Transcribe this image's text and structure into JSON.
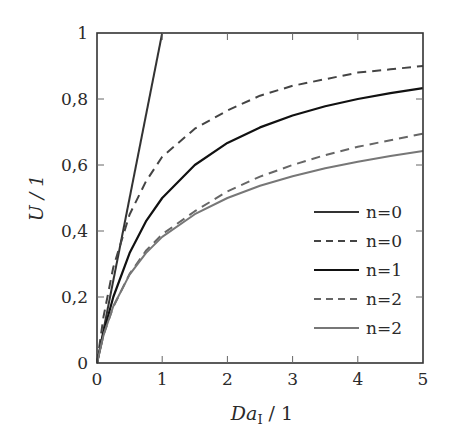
{
  "chart_data": {
    "type": "line",
    "title": "",
    "xlabel": "Da_I / 1",
    "xlabel_main": "Da",
    "xlabel_sub": "I",
    "xlabel_unit": " / 1",
    "ylabel": "U / 1",
    "xlim": [
      0,
      5
    ],
    "ylim": [
      0,
      1
    ],
    "grid": false,
    "legend_position": "lower right",
    "x_ticks": [
      "0",
      "1",
      "2",
      "3",
      "4",
      "5"
    ],
    "y_ticks": [
      "0",
      "0,2",
      "0,4",
      "0,6",
      "0,8",
      "1"
    ],
    "series": [
      {
        "name": "n=0",
        "style": "solid",
        "color": "#333333",
        "width": 2,
        "x": [
          0,
          1.0
        ],
        "y": [
          0,
          1.0
        ]
      },
      {
        "name": "n=0",
        "style": "dashed",
        "color": "#444444",
        "width": 2,
        "x": [
          0,
          0.1,
          0.25,
          0.5,
          0.75,
          1,
          1.5,
          2,
          2.5,
          3,
          3.5,
          4,
          4.5,
          5
        ],
        "y": [
          0,
          0.14,
          0.29,
          0.45,
          0.55,
          0.625,
          0.71,
          0.765,
          0.81,
          0.84,
          0.86,
          0.88,
          0.89,
          0.9
        ]
      },
      {
        "name": "n=1",
        "style": "solid",
        "color": "#111111",
        "width": 2.2,
        "x": [
          0,
          0.1,
          0.25,
          0.5,
          0.75,
          1,
          1.5,
          2,
          2.5,
          3,
          3.5,
          4,
          4.5,
          5
        ],
        "y": [
          0,
          0.091,
          0.2,
          0.333,
          0.429,
          0.5,
          0.6,
          0.667,
          0.714,
          0.75,
          0.778,
          0.8,
          0.818,
          0.833
        ]
      },
      {
        "name": "n=2",
        "style": "dashed",
        "color": "#666666",
        "width": 2,
        "x": [
          0,
          0.1,
          0.25,
          0.5,
          0.75,
          1,
          1.5,
          2,
          2.5,
          3,
          3.5,
          4,
          4.5,
          5
        ],
        "y": [
          0,
          0.085,
          0.17,
          0.27,
          0.34,
          0.39,
          0.46,
          0.52,
          0.565,
          0.6,
          0.63,
          0.655,
          0.675,
          0.695
        ]
      },
      {
        "name": "n=2",
        "style": "solid",
        "color": "#777777",
        "width": 2,
        "x": [
          0,
          0.1,
          0.25,
          0.5,
          0.75,
          1,
          1.5,
          2,
          2.5,
          3,
          3.5,
          4,
          4.5,
          5
        ],
        "y": [
          0,
          0.084,
          0.172,
          0.268,
          0.333,
          0.382,
          0.451,
          0.5,
          0.537,
          0.566,
          0.59,
          0.61,
          0.627,
          0.642
        ]
      }
    ]
  }
}
